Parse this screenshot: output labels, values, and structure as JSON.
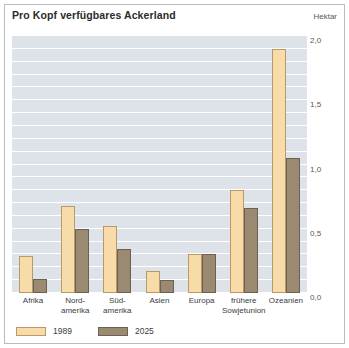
{
  "chart_data": {
    "type": "bar",
    "title": "Pro Kopf verfügbares Ackerland",
    "unit_label": "Hektar",
    "xlabel": "",
    "ylabel": "Hektar",
    "ylim": [
      0,
      2.0
    ],
    "ytick_labels": [
      "0,0",
      "0,5",
      "1,0",
      "1,5",
      "2,0"
    ],
    "ytick_values": [
      0,
      0.5,
      1.0,
      1.5,
      2.0
    ],
    "grid": true,
    "grid_step": 0.1,
    "legend_position": "bottom-left",
    "categories": [
      "Afrika",
      "Nord-\namerika",
      "Süd-\namerika",
      "Asien",
      "Europa",
      "frühere\nSowjetunion",
      "Ozeanien"
    ],
    "series": [
      {
        "name": "1989",
        "color": "#f7dcaa",
        "values": [
          0.29,
          0.68,
          0.52,
          0.17,
          0.3,
          0.8,
          1.9
        ]
      },
      {
        "name": "2025",
        "color": "#9b8a72",
        "values": [
          0.11,
          0.5,
          0.34,
          0.1,
          0.3,
          0.66,
          1.05
        ]
      }
    ]
  },
  "colors": {
    "plot_background": "#dde3e9",
    "gridline": "#ffffff",
    "frame_border": "#b9bcbe",
    "series_1989": "#f7dcaa",
    "series_2025": "#9b8a72",
    "title_text": "#2b2b2b",
    "axis_text": "#55585a"
  }
}
